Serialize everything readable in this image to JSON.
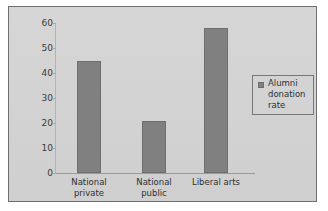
{
  "chart_data": {
    "type": "bar",
    "title": "",
    "subtitle": "",
    "xlabel": "",
    "ylabel": "",
    "categories": [
      "National private",
      "National public",
      "Liberal arts"
    ],
    "category_lines": [
      [
        "National",
        "private"
      ],
      [
        "National",
        "public"
      ],
      [
        "Liberal arts",
        ""
      ]
    ],
    "series": [
      {
        "name": "Alumni donation rate",
        "values": [
          45,
          21,
          58
        ],
        "color": "#808080"
      }
    ],
    "ylim": [
      0,
      60
    ],
    "yticks": [
      0,
      10,
      20,
      30,
      40,
      50,
      60
    ],
    "ytick_labels": [
      "0",
      "10",
      "20",
      "30",
      "40",
      "50",
      "60"
    ],
    "grid": false,
    "legend": {
      "position": "right",
      "entries": [
        {
          "label_lines": [
            "Alumni",
            "donation",
            "rate"
          ],
          "label": "Alumni donation rate",
          "swatch_color": "#808080"
        }
      ]
    },
    "colors": {
      "plot_background": "#d3d3d3",
      "page_background": "#ffffff",
      "frame_border": "#6f6f6f",
      "axis_line": "#9a9a9a",
      "bar_fill": "#808080",
      "text": "#2f2f2f"
    }
  }
}
